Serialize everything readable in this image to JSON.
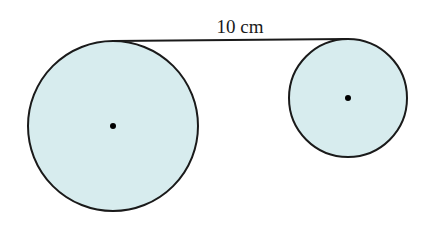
{
  "diagram": {
    "label": "10 cm",
    "colors": {
      "fill": "#d7ecee",
      "stroke": "#1a1a1a",
      "background": "#ffffff"
    },
    "circles": [
      {
        "name": "large-circle",
        "cx": 113,
        "cy": 126,
        "r": 85
      },
      {
        "name": "small-circle",
        "cx": 348,
        "cy": 98,
        "r": 59
      }
    ],
    "tangent_line": {
      "x1": 113,
      "y1": 41,
      "x2": 348,
      "y2": 39
    }
  }
}
